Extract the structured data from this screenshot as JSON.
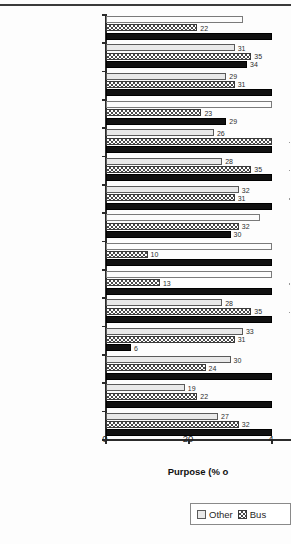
{
  "chart_data": {
    "type": "bar",
    "orientation": "horizontal",
    "title": "",
    "xlabel": "Purpose (% o",
    "ylabel": "",
    "xlim": [
      0,
      40
    ],
    "xticks": [
      0,
      20,
      40
    ],
    "xtick_labels": [
      "0",
      "20",
      "4"
    ],
    "grid": false,
    "legend_position": "bottom-right",
    "legend_entries": [
      "Other",
      "Bus"
    ],
    "categories": [
      "USA",
      "France",
      "Germany",
      "Republic of Ireland",
      "Netherlands",
      "Belgium",
      "Italy",
      "Spain",
      "Australia",
      "Canada",
      "Sweden",
      "Switzerland",
      "Norway",
      "Japan",
      "Denmark"
    ],
    "highlighted_category": "Japan",
    "series": [
      {
        "name": "Other",
        "values": [
          33,
          31,
          29,
          40,
          26,
          28,
          32,
          37,
          40,
          40,
          28,
          33,
          30,
          19,
          27
        ],
        "labels": [
          "",
          "31",
          "29",
          "",
          "26",
          "28",
          "32",
          "",
          "",
          "",
          "28",
          "33",
          "30",
          "19",
          "27"
        ]
      },
      {
        "name": "Bus",
        "values": [
          22,
          35,
          31,
          23,
          40,
          35,
          31,
          32,
          10,
          13,
          35,
          31,
          24,
          22,
          32
        ],
        "labels": [
          "22",
          "35",
          "31",
          "23",
          "",
          "35",
          "31",
          "32",
          "10",
          "13",
          "35",
          "31",
          "24",
          "22",
          "32"
        ]
      },
      {
        "name": "Holiday",
        "values": [
          40,
          34,
          40,
          29,
          40,
          40,
          40,
          30,
          40,
          40,
          40,
          6,
          40,
          40,
          40
        ],
        "labels": [
          "",
          "34",
          "",
          "29",
          "",
          "",
          "",
          "30",
          "",
          "",
          "",
          "6",
          "",
          "",
          ""
        ]
      }
    ]
  }
}
